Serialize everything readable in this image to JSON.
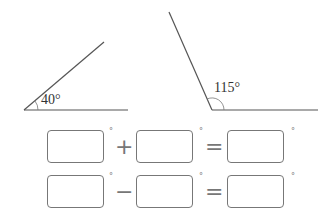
{
  "angles": [
    {
      "label": "40°",
      "value": 40
    },
    {
      "label": "115°",
      "value": 115
    }
  ],
  "equations": [
    {
      "operator": "+",
      "equals": "=",
      "degree": "°"
    },
    {
      "operator": "−",
      "equals": "=",
      "degree": "°"
    }
  ]
}
